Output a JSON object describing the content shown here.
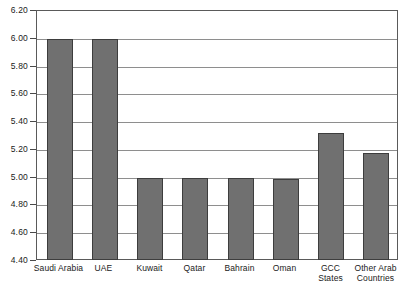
{
  "chart_data": {
    "type": "bar",
    "title": "",
    "subtitle": "",
    "xlabel": "",
    "ylabel": "",
    "ylim": [
      4.4,
      6.2
    ],
    "ytick_step": 0.2,
    "grid": true,
    "legend": "none",
    "orientation": "vertical",
    "bar_color": "#707070",
    "bar_edge_color": "#3d3d3d",
    "gridline_color": "#8e8e8e",
    "frame_color": "#5a5a5a",
    "categories": [
      "Saudi Arabia",
      "UAE",
      "Kuwait",
      "Qatar",
      "Bahrain",
      "Oman",
      "GCC States",
      "Other Arab Countries"
    ],
    "category_label_lines": [
      [
        "Saudi Arabia"
      ],
      [
        "UAE"
      ],
      [
        "Kuwait"
      ],
      [
        "Qatar"
      ],
      [
        "Bahrain"
      ],
      [
        "Oman"
      ],
      [
        "GCC",
        "States"
      ],
      [
        "Other Arab",
        "Countries"
      ]
    ],
    "values": [
      6.0,
      6.0,
      5.0,
      5.0,
      5.0,
      4.99,
      5.32,
      5.18
    ],
    "ytick_labels": [
      "6.20",
      "6.00",
      "5.80",
      "5.60",
      "5.40",
      "5.20",
      "5.00",
      "4.80",
      "4.60",
      "4.40"
    ],
    "ytick_values": [
      6.2,
      6.0,
      5.8,
      5.6,
      5.4,
      5.2,
      5.0,
      4.8,
      4.6,
      4.4
    ]
  }
}
